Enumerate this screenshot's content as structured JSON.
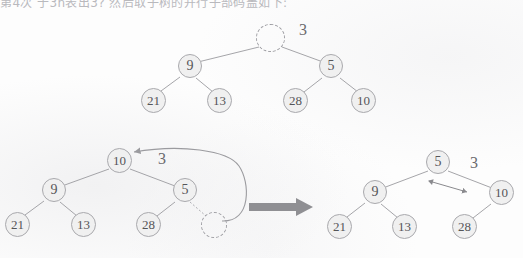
{
  "page": {
    "caption_top": "第4次 于3n表出3? 然后取子树的并行子部码盖如下:",
    "background_color": "#fdfdfd",
    "node_fill": "#f0f0f0",
    "node_stroke": "#a9a9ad",
    "text_color": "#555558",
    "edge_color": "#9b9b9f",
    "arrow_color": "#8f8f93"
  },
  "diagrams": [
    {
      "id": "tree-top",
      "name": "initial-heap-with-empty-root",
      "annotation": "3",
      "nodes": [
        {
          "id": "t1-root",
          "label": "",
          "empty": true
        },
        {
          "id": "t1-n9",
          "label": "9",
          "empty": false
        },
        {
          "id": "t1-n5",
          "label": "5",
          "empty": false
        },
        {
          "id": "t1-n21",
          "label": "21",
          "empty": false
        },
        {
          "id": "t1-n13",
          "label": "13",
          "empty": false
        },
        {
          "id": "t1-n28",
          "label": "28",
          "empty": false
        },
        {
          "id": "t1-n10",
          "label": "10",
          "empty": false
        }
      ]
    },
    {
      "id": "tree-before",
      "name": "heap-before-sift",
      "annotation": "3",
      "nodes": [
        {
          "id": "t2-root",
          "label": "10",
          "empty": false
        },
        {
          "id": "t2-n9",
          "label": "9",
          "empty": false
        },
        {
          "id": "t2-n5",
          "label": "5",
          "empty": false
        },
        {
          "id": "t2-n21",
          "label": "21",
          "empty": false
        },
        {
          "id": "t2-n13",
          "label": "13",
          "empty": false
        },
        {
          "id": "t2-n28",
          "label": "28",
          "empty": false
        },
        {
          "id": "t2-hole",
          "label": "",
          "empty": true
        }
      ]
    },
    {
      "id": "tree-after",
      "name": "heap-after-sift",
      "annotation": "3",
      "nodes": [
        {
          "id": "t3-root",
          "label": "5",
          "empty": false
        },
        {
          "id": "t3-n9",
          "label": "9",
          "empty": false
        },
        {
          "id": "t3-n10",
          "label": "10",
          "empty": false
        },
        {
          "id": "t3-n21",
          "label": "21",
          "empty": false
        },
        {
          "id": "t3-n13",
          "label": "13",
          "empty": false
        },
        {
          "id": "t3-n28",
          "label": "28",
          "empty": false
        }
      ]
    }
  ]
}
